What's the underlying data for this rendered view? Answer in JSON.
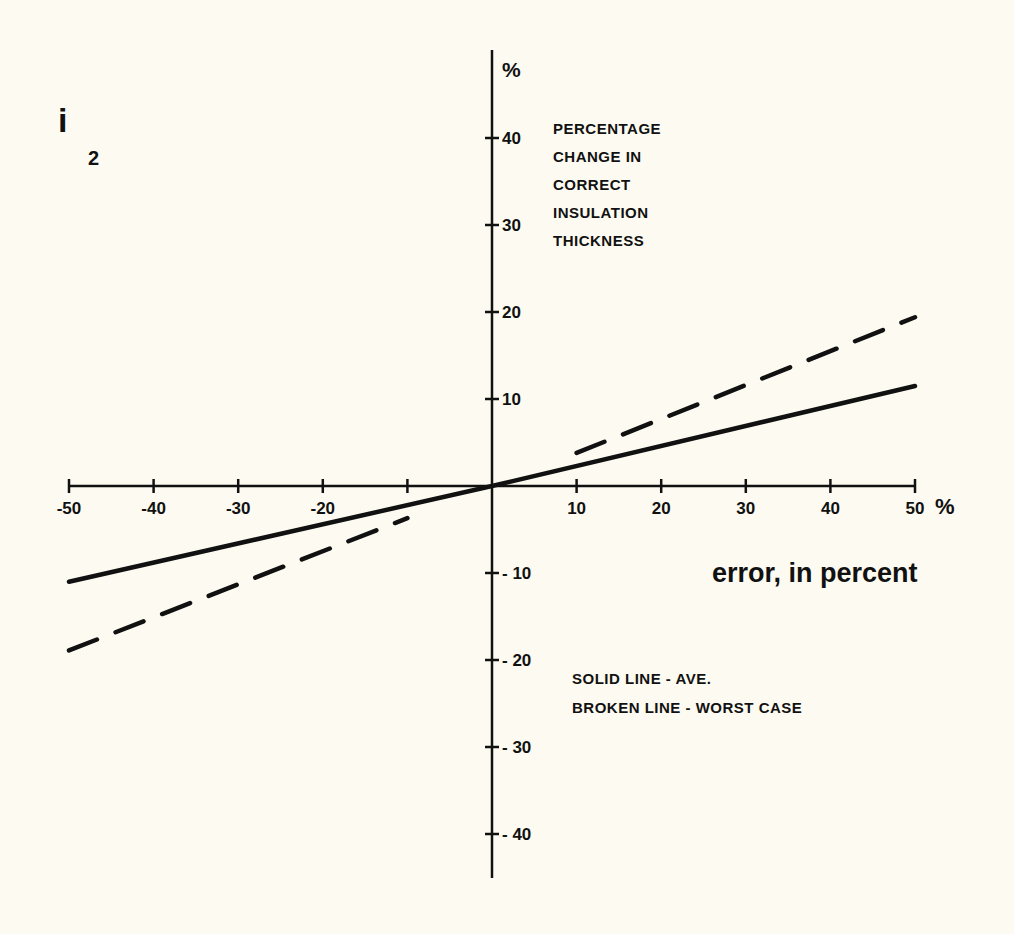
{
  "chart_data": {
    "type": "line",
    "title": "",
    "figure_label": {
      "main": "i",
      "subscript": "2"
    },
    "xlabel": "error, in percent",
    "x_unit": "%",
    "ylabel": "PERCENTAGE CHANGE IN CORRECT INSULATION THICKNESS",
    "ylabel_lines": [
      "PERCENTAGE",
      "CHANGE IN",
      "CORRECT",
      "INSULATION",
      "THICKNESS"
    ],
    "y_unit": "%",
    "xlim": [
      -50,
      50
    ],
    "ylim": [
      -45,
      50
    ],
    "x_ticks": [
      -50,
      -40,
      -30,
      -20,
      -10,
      10,
      20,
      30,
      40,
      50
    ],
    "x_tick_labels": [
      "-50",
      "-40",
      "-30",
      "-20",
      "",
      "10",
      "20",
      "30",
      "40",
      "50"
    ],
    "y_ticks": [
      40,
      30,
      20,
      10,
      -10,
      -20,
      -30,
      -40
    ],
    "y_tick_labels": [
      "40",
      "30",
      "20",
      "10",
      "-10",
      "-20",
      "-30",
      "-40"
    ],
    "grid": false,
    "legend": {
      "position": "lower right",
      "entries": [
        "SOLID LINE - AVE.",
        "BROKEN LINE - WORST CASE"
      ]
    },
    "series": [
      {
        "name": "Average (solid line)",
        "style": "solid",
        "segments": [
          {
            "x": [
              -50,
              0,
              50
            ],
            "y": [
              -11.0,
              0,
              11.5
            ]
          }
        ]
      },
      {
        "name": "Worst case (broken line)",
        "style": "dashed",
        "segments": [
          {
            "x": [
              -50,
              -10
            ],
            "y": [
              -18.9,
              -3.7
            ]
          },
          {
            "x": [
              10,
              50
            ],
            "y": [
              3.8,
              19.4
            ]
          }
        ]
      }
    ]
  },
  "colors": {
    "background": "#fdfbf1",
    "ink": "#111111"
  }
}
